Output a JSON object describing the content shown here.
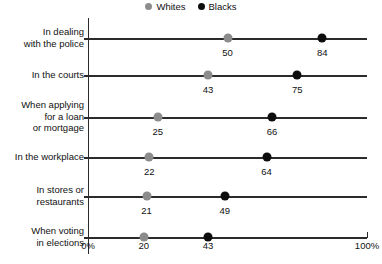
{
  "chart_data": {
    "type": "scatter",
    "title": "",
    "subtitle": "",
    "xlabel": "",
    "ylabel": "",
    "xlim": [
      0,
      100
    ],
    "grid": false,
    "legend_position": "top-center",
    "xticks": [
      {
        "value": 0,
        "label": "0%"
      },
      {
        "value": 20,
        "label": "20"
      },
      {
        "value": 43,
        "label": "43"
      },
      {
        "value": 100,
        "label": "100%"
      }
    ],
    "legend": [
      {
        "name": "Whites",
        "color": "#8c8c8c",
        "marker": "circle"
      },
      {
        "name": "Blacks",
        "color": "#0d0d0d",
        "marker": "circle"
      }
    ],
    "categories": [
      "In dealing\nwith the police",
      "In the courts",
      "When applying\nfor a loan\nor mortgage",
      "In the workplace",
      "In stores or\nrestaurants",
      "When voting\nin elections"
    ],
    "series": [
      {
        "name": "Whites",
        "color": "#8c8c8c",
        "values": [
          50,
          43,
          25,
          22,
          21,
          20
        ]
      },
      {
        "name": "Blacks",
        "color": "#0d0d0d",
        "values": [
          84,
          75,
          66,
          64,
          49,
          43
        ]
      }
    ],
    "point_labels": [
      {
        "category": "In dealing with the police",
        "whites": "50",
        "blacks": "84",
        "shown": true
      },
      {
        "category": "In the courts",
        "whites": "43",
        "blacks": "75",
        "shown": true
      },
      {
        "category": "When applying for a loan or mortgage",
        "whites": "25",
        "blacks": "66",
        "shown": true
      },
      {
        "category": "In the workplace",
        "whites": "22",
        "blacks": "64",
        "shown": true
      },
      {
        "category": "In stores or restaurants",
        "whites": "21",
        "blacks": "49",
        "shown": true
      },
      {
        "category": "When voting in elections",
        "whites": "20",
        "blacks": "43",
        "shown": false
      }
    ]
  },
  "rows": [
    {
      "label": "In dealing\nwith the police",
      "whites": 50,
      "blacks": 84,
      "whites_label": "50",
      "blacks_label": "84",
      "show_values": true
    },
    {
      "label": "In the courts",
      "whites": 43,
      "blacks": 75,
      "whites_label": "43",
      "blacks_label": "75",
      "show_values": true
    },
    {
      "label": "When applying\nfor a loan\nor mortgage",
      "whites": 25,
      "blacks": 66,
      "whites_label": "25",
      "blacks_label": "66",
      "show_values": true
    },
    {
      "label": "In the workplace",
      "whites": 22,
      "blacks": 64,
      "whites_label": "22",
      "blacks_label": "64",
      "show_values": true
    },
    {
      "label": "In stores or\nrestaurants",
      "whites": 21,
      "blacks": 49,
      "whites_label": "21",
      "blacks_label": "49",
      "show_values": true
    },
    {
      "label": "When voting\nin elections",
      "whites": 20,
      "blacks": 43,
      "whites_label": "20",
      "blacks_label": "43",
      "show_values": false
    }
  ],
  "legend": {
    "whites_label": "Whites",
    "blacks_label": "Blacks",
    "whites_color": "#8c8c8c",
    "blacks_color": "#0d0d0d"
  },
  "axis": {
    "min_label": "0%",
    "mid1_label": "20",
    "mid2_label": "43",
    "max_label": "100%"
  }
}
